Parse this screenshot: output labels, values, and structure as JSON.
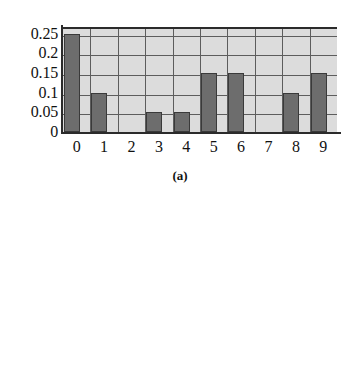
{
  "figure": {
    "caption_a": "(a)",
    "bar_color": "#6d6d6d",
    "plot_background": "#dcdcdc",
    "grid_color": "#5d5d5d",
    "axis_color": "#2b2b2b"
  },
  "chart_data": [
    {
      "type": "bar",
      "panel": "a",
      "title": "",
      "subtitle": "(a)",
      "xlabel": "",
      "ylabel": "",
      "categories": [
        "0",
        "1",
        "2",
        "3",
        "4",
        "5",
        "6",
        "7",
        "8",
        "9"
      ],
      "values": [
        0.25,
        0.1,
        0,
        0.05,
        0.05,
        0.15,
        0.15,
        0,
        0.1,
        0.15
      ],
      "ytick_labels": [
        "0.25",
        "0.2",
        "0.15",
        "0.1",
        "0.05",
        "0"
      ],
      "ytick_values": [
        0.25,
        0.2,
        0.15,
        0.1,
        0.05,
        0
      ],
      "xtick_labels": [
        "0",
        "1",
        "2",
        "3",
        "4",
        "5",
        "6",
        "7",
        "8",
        "9"
      ],
      "ylim": [
        0,
        0.2675
      ],
      "grid": true,
      "legend": false
    },
    {
      "type": "bar",
      "panel": "b",
      "title": "",
      "subtitle": "",
      "xlabel": "",
      "ylabel": "",
      "categories": [
        "0",
        "1",
        "2",
        "3",
        "4",
        "5",
        "6",
        "7",
        "8",
        "9"
      ],
      "values": [
        0.05,
        0,
        0.05,
        0.15,
        0.25,
        0.25,
        0.15,
        0.05,
        0,
        0.05
      ],
      "ytick_labels": [
        "0.2",
        "0.15",
        "0.1",
        "0.05",
        "0"
      ],
      "ytick_values": [
        0.2,
        0.15,
        0.1,
        0.05,
        0
      ],
      "xtick_labels": [
        "0",
        "1",
        "2",
        "3",
        "4",
        "5",
        "6",
        "7",
        "8",
        "9"
      ],
      "ylim": [
        0,
        0.25
      ],
      "grid": true,
      "legend": false
    }
  ]
}
